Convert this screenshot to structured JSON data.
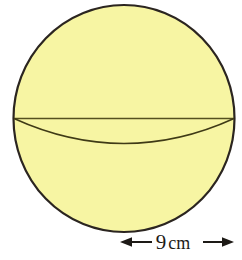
{
  "figure": {
    "kind": "sphere-diagram",
    "background_color": "#ffffff",
    "sphere": {
      "name": "sphere",
      "fill_color": "#f7f5a3",
      "outline_color": "#2b2520",
      "outline_width": 2.2,
      "center_x": 124,
      "center_y": 118.5,
      "radius_x": 110.5,
      "radius_y": 113.5
    },
    "diameter_line": {
      "name": "equator-diameter-line",
      "color": "#55501f",
      "width": 1.4,
      "x1": 14,
      "x2": 234,
      "y": 118.5
    },
    "equator_arc": {
      "name": "equator-front-arc",
      "color": "#3f3a16",
      "width": 1.4,
      "x1": 14,
      "x2": 234,
      "y": 118.5,
      "sag": 25
    }
  },
  "dimension": {
    "name": "radius-dimension",
    "value": "9",
    "unit": "cm",
    "text": "9 cm",
    "arrow_color": "#1d1a16",
    "arrow_y": 242,
    "arrow_x_start": 120,
    "arrow_x_end": 234,
    "label_gap_left": 150,
    "label_gap_right": 203
  }
}
